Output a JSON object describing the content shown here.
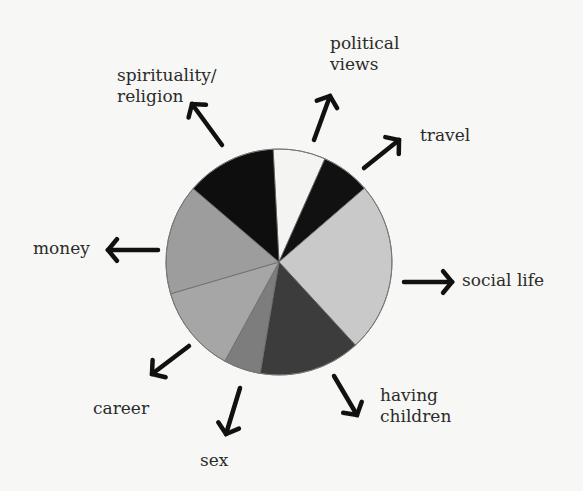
{
  "chart_data": {
    "type": "pie",
    "title": "",
    "center": [
      279,
      262
    ],
    "radius": 113,
    "start_angle_deg": -3,
    "slices": [
      {
        "name": "political views",
        "percent": 7.5,
        "color": "#f4f4f2"
      },
      {
        "name": "travel",
        "percent": 7.0,
        "color": "#111111"
      },
      {
        "name": "social life",
        "percent": 24.5,
        "color": "#c9c9c9"
      },
      {
        "name": "having children",
        "percent": 14.5,
        "color": "#3c3c3c"
      },
      {
        "name": "sex",
        "percent": 5.3,
        "color": "#7d7d7d"
      },
      {
        "name": "career",
        "percent": 12.5,
        "color": "#a6a6a6"
      },
      {
        "name": "money",
        "percent": 15.8,
        "color": "#9d9d9d"
      },
      {
        "name": "spirituality/religion",
        "percent": 12.9,
        "color": "#0e0e0e"
      }
    ]
  },
  "labels": {
    "spirituality_line1": "spirituality/",
    "spirituality_line2": "religion",
    "political_line1": "political",
    "political_line2": "views",
    "travel": "travel",
    "social_life": "social life",
    "having_line1": "having",
    "having_line2": "children",
    "sex": "sex",
    "career": "career",
    "money": "money"
  },
  "arrows": [
    {
      "name": "spirituality-arrow",
      "x1": 222,
      "y1": 145,
      "x2": 192,
      "y2": 104
    },
    {
      "name": "political-arrow",
      "x1": 314,
      "y1": 140,
      "x2": 330,
      "y2": 96
    },
    {
      "name": "travel-arrow",
      "x1": 364,
      "y1": 168,
      "x2": 399,
      "y2": 140
    },
    {
      "name": "social-arrow",
      "x1": 404,
      "y1": 282,
      "x2": 452,
      "y2": 282
    },
    {
      "name": "having-arrow",
      "x1": 334,
      "y1": 376,
      "x2": 357,
      "y2": 415
    },
    {
      "name": "sex-arrow",
      "x1": 240,
      "y1": 388,
      "x2": 226,
      "y2": 434
    },
    {
      "name": "career-arrow",
      "x1": 189,
      "y1": 346,
      "x2": 152,
      "y2": 374
    },
    {
      "name": "money-arrow",
      "x1": 158,
      "y1": 250,
      "x2": 108,
      "y2": 250
    }
  ]
}
